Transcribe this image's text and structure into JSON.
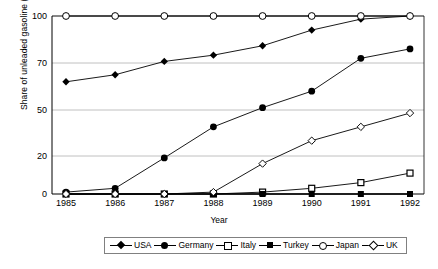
{
  "chart_data": {
    "type": "line",
    "title": "",
    "xlabel": "Year",
    "ylabel": "Share of unleaded gasoline (%)",
    "x": [
      1985,
      1986,
      1987,
      1988,
      1989,
      1990,
      1991,
      1992
    ],
    "xticklabels": [
      "1985",
      "1986",
      "1987",
      "1988",
      "1989",
      "1990",
      "1991",
      "1992"
    ],
    "yticklabels": [
      "0",
      "20",
      "50",
      "70",
      "100"
    ],
    "ytickvalues": [
      0,
      20,
      50,
      70,
      100
    ],
    "ylim": [
      0,
      100
    ],
    "grid": "horizontal",
    "legend_position": "bottom",
    "series": [
      {
        "name": "USA",
        "marker": "diamond-filled",
        "values": [
          62,
          65,
          71,
          75,
          81,
          91,
          98,
          100
        ]
      },
      {
        "name": "Germany",
        "marker": "circle-filled",
        "values": [
          1,
          3,
          19,
          39,
          51,
          58,
          73,
          79
        ]
      },
      {
        "name": "Italy",
        "marker": "square-open",
        "values": [
          0,
          0,
          0,
          0,
          1,
          3,
          6,
          11
        ]
      },
      {
        "name": "Turkey",
        "marker": "square-filled",
        "values": [
          0,
          0,
          0,
          0,
          0,
          0,
          0,
          0
        ]
      },
      {
        "name": "Japan",
        "marker": "circle-open",
        "values": [
          100,
          100,
          100,
          100,
          100,
          100,
          100,
          100
        ]
      },
      {
        "name": "UK",
        "marker": "diamond-open",
        "values": [
          0,
          0,
          0,
          1,
          16,
          30,
          39,
          48
        ]
      }
    ]
  },
  "legend": {
    "items": [
      {
        "label": "USA",
        "icon": "diamond-filled-icon"
      },
      {
        "label": "Germany",
        "icon": "circle-filled-icon"
      },
      {
        "label": "Italy",
        "icon": "square-open-icon"
      },
      {
        "label": "Turkey",
        "icon": "square-filled-icon"
      },
      {
        "label": "Japan",
        "icon": "circle-open-icon"
      },
      {
        "label": "UK",
        "icon": "diamond-open-icon"
      }
    ]
  },
  "axes": {
    "y_title": "Share of unleaded gasoline (%)",
    "x_title": "Year"
  },
  "colors": {
    "line": "#000000",
    "grid": "#b0b0b0",
    "axis": "#000000",
    "background": "#ffffff"
  }
}
